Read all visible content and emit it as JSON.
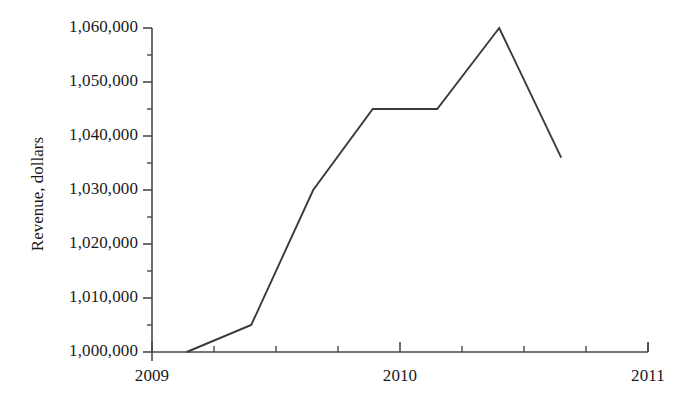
{
  "chart_data": {
    "type": "line",
    "title": "",
    "xlabel": "",
    "ylabel": "Revenue, dollars",
    "xlim": [
      2009,
      2011
    ],
    "ylim": [
      1000000,
      1060000
    ],
    "grid": false,
    "legend": null,
    "x_tick_labels": [
      "2009",
      "2010",
      "2011"
    ],
    "x_tick_values": [
      2009,
      2010,
      2011
    ],
    "x_minor_tick_values": [
      2009.25,
      2009.5,
      2009.75,
      2010.25,
      2010.5,
      2010.75
    ],
    "y_tick_labels": [
      "1,000,000",
      "1,010,000",
      "1,020,000",
      "1,030,000",
      "1,040,000",
      "1,050,000",
      "1,060,000"
    ],
    "y_tick_values": [
      1000000,
      1010000,
      1020000,
      1030000,
      1040000,
      1050000,
      1060000
    ],
    "y_minor_tick_values": [
      1005000,
      1015000,
      1025000,
      1035000,
      1045000,
      1055000
    ],
    "series": [
      {
        "name": "Revenue",
        "color": "#3a3a3a",
        "x": [
          2009.14,
          2009.4,
          2009.65,
          2009.89,
          2010.15,
          2010.4,
          2010.65
        ],
        "y": [
          1000000,
          1005000,
          1030000,
          1045000,
          1045000,
          1060000,
          1036000
        ]
      }
    ]
  },
  "axis": {
    "y_title": "Revenue, dollars",
    "y_ticks": [
      {
        "label": "1,060,000",
        "value": 1060000
      },
      {
        "label": "1,050,000",
        "value": 1050000
      },
      {
        "label": "1,040,000",
        "value": 1040000
      },
      {
        "label": "1,030,000",
        "value": 1030000
      },
      {
        "label": "1,020,000",
        "value": 1020000
      },
      {
        "label": "1,010,000",
        "value": 1010000
      },
      {
        "label": "1,000,000",
        "value": 1000000
      }
    ],
    "x_ticks": [
      {
        "label": "2009",
        "value": 2009
      },
      {
        "label": "2010",
        "value": 2010
      },
      {
        "label": "2011",
        "value": 2011
      }
    ]
  },
  "style": {
    "axis_color": "#4a4a4a",
    "line_color": "#3a3a3a",
    "text_color": "#1a1a1a",
    "background": "#ffffff"
  }
}
